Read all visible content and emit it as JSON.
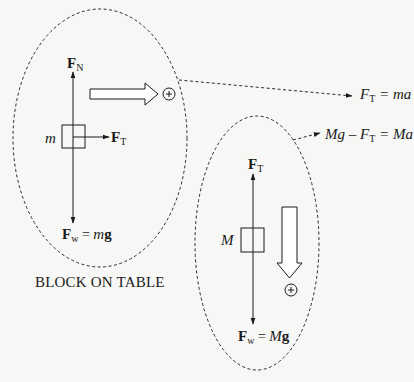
{
  "diagram": {
    "title_caption": "BLOCK ON TABLE",
    "block_on_table": {
      "mass_label": "m",
      "normal_force": {
        "symbol": "F",
        "subscript": "N"
      },
      "tension_force": {
        "symbol": "F",
        "subscript": "T"
      },
      "weight_force": {
        "symbol": "F",
        "subscript": "w",
        "equals": "=",
        "rhs_italic": "m",
        "rhs_bold": "g"
      },
      "positive_direction": "right",
      "positive_symbol": "+"
    },
    "hanging_block": {
      "mass_label": "M",
      "tension_force": {
        "symbol": "F",
        "subscript": "T"
      },
      "weight_force": {
        "symbol": "F",
        "subscript": "w",
        "equals": "=",
        "rhs_italic": "M",
        "rhs_bold": "g"
      },
      "positive_direction": "down",
      "positive_symbol": "+"
    },
    "equations": [
      {
        "lhs": "F",
        "lhs_sub": "T",
        "rest": " = ma"
      },
      {
        "pre": "Mg – F",
        "sub": "T",
        "rest": " = Ma"
      }
    ],
    "colors": {
      "background": "#f7f7f6",
      "ink": "#1a1a1a"
    }
  }
}
